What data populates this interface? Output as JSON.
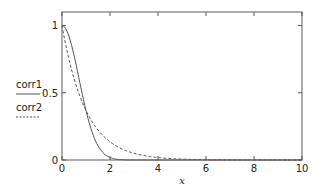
{
  "chart_data": {
    "type": "line",
    "title": "",
    "xlabel": "x",
    "ylabel": "",
    "xlim": [
      0,
      10
    ],
    "ylim": [
      0,
      1.1
    ],
    "x_ticks": [
      0,
      2,
      4,
      6,
      8,
      10
    ],
    "x_tick_labels": [
      "0",
      "2",
      "4",
      "6",
      "8",
      "10"
    ],
    "y_ticks": [
      0,
      0.5,
      1
    ],
    "y_tick_labels": [
      "0",
      "0.5",
      "1"
    ],
    "grid": false,
    "legend": {
      "placement": "left",
      "entries": [
        {
          "name": "corr1",
          "style": "solid"
        },
        {
          "name": "corr2",
          "style": "dashed"
        }
      ]
    },
    "series": [
      {
        "name": "corr1",
        "style": "solid",
        "formula": "exp(-x^2)",
        "x": [
          0,
          0.25,
          0.5,
          0.75,
          1,
          1.25,
          1.5,
          1.75,
          2,
          2.5,
          3,
          4,
          6,
          8,
          10
        ],
        "y": [
          1,
          0.939,
          0.779,
          0.57,
          0.368,
          0.21,
          0.105,
          0.047,
          0.018,
          0.002,
          0.0001,
          0,
          0,
          0,
          0
        ]
      },
      {
        "name": "corr2",
        "style": "dashed",
        "formula": "exp(-x)",
        "x": [
          0,
          0.25,
          0.5,
          0.75,
          1,
          1.5,
          2,
          2.5,
          3,
          3.5,
          4,
          5,
          6,
          7,
          8,
          9,
          10
        ],
        "y": [
          1,
          0.779,
          0.607,
          0.472,
          0.368,
          0.223,
          0.135,
          0.082,
          0.05,
          0.03,
          0.018,
          0.0067,
          0.0025,
          0.0009,
          0.0003,
          0.0001,
          5e-05
        ]
      }
    ]
  }
}
